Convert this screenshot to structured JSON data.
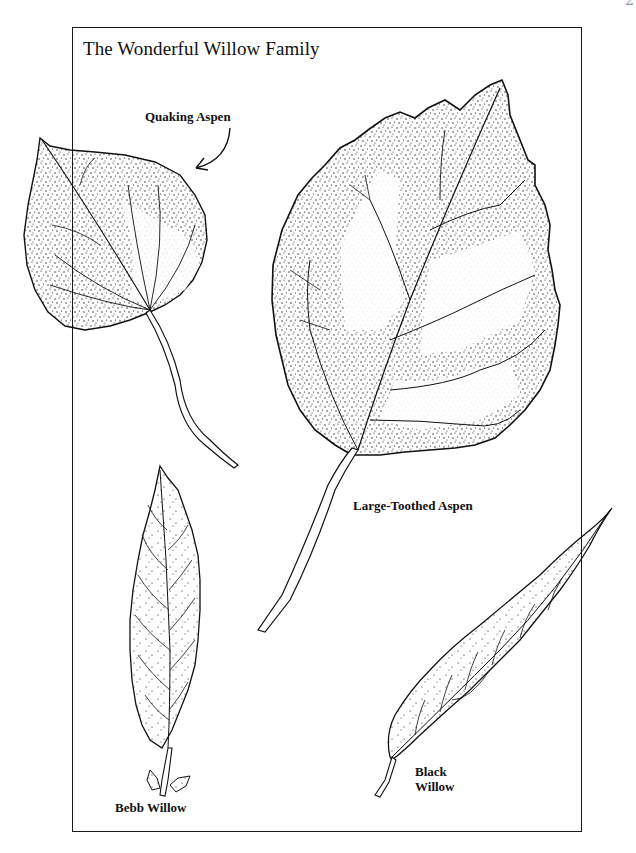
{
  "page": {
    "page_number_partial": "2"
  },
  "figure": {
    "title": "The Wonderful Willow Family",
    "frame_color": "#1a1a1a",
    "ink_color": "#111111",
    "background_color": "#ffffff"
  },
  "leaves": [
    {
      "id": "quaking-aspen",
      "label": "Quaking Aspen",
      "has_arrow": true
    },
    {
      "id": "large-toothed-aspen",
      "label": "Large-Toothed Aspen",
      "has_arrow": false
    },
    {
      "id": "bebb-willow",
      "label": "Bebb Willow",
      "has_arrow": false
    },
    {
      "id": "black-willow",
      "label_line1": "Black",
      "label_line2": "Willow",
      "has_arrow": false
    }
  ]
}
